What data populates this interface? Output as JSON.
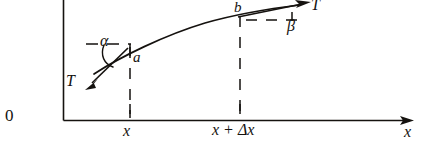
{
  "figure": {
    "type": "vector-diagram",
    "background_color": "#ffffff",
    "ink_color": "#15120f",
    "axes": {
      "origin_label": "0",
      "x_axis_label": "x",
      "x_axis_arrow": "right-arrow-icon",
      "y_axis_visible": true,
      "y_axis_label": ""
    },
    "tick_labels": [
      {
        "name": "x",
        "text": "x"
      },
      {
        "name": "x-plus-delta-x",
        "text": "x + Δx"
      }
    ],
    "points": [
      {
        "name": "a",
        "label": "a"
      },
      {
        "name": "b",
        "label": "b"
      }
    ],
    "vectors": [
      {
        "name": "tension-left",
        "label": "T",
        "direction": "down-left",
        "anchor_point": "a"
      },
      {
        "name": "tension-right",
        "label": "T",
        "direction": "up-right",
        "anchor_point": "b"
      }
    ],
    "angles": [
      {
        "name": "alpha",
        "label": "α",
        "at_point": "a",
        "between": "dashed-horizontal and tension-left"
      },
      {
        "name": "beta",
        "label": "β",
        "at_point": "b",
        "between": "dashed-horizontal and tension-right"
      }
    ],
    "guides": [
      {
        "name": "dropline-x",
        "style": "dashed",
        "from": "a",
        "to": "x-axis"
      },
      {
        "name": "dropline-x-plus-delta-x",
        "style": "dashed",
        "from": "b",
        "to": "x-axis"
      },
      {
        "name": "horizontal-reference-a",
        "style": "dashed"
      },
      {
        "name": "horizontal-reference-b",
        "style": "dashed"
      }
    ]
  }
}
